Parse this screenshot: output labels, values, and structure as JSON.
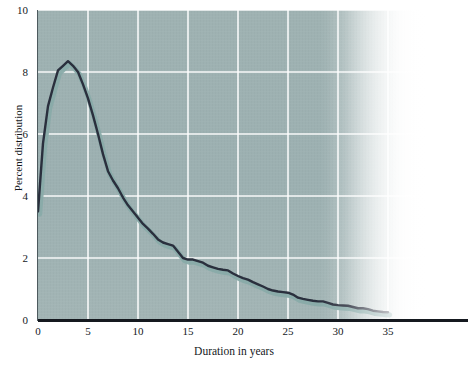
{
  "figure": {
    "title_remnant": "",
    "background_color": "#ffffff",
    "panel_color": "#9fb2b2",
    "gridline_color": "#ffffff",
    "line_color": "#2a2f3d",
    "shadow_color": "#8fb0ae",
    "axis_color": "#15191f"
  },
  "axes": {
    "x": {
      "label": "Duration in years",
      "ticks": [
        "0",
        "5",
        "10",
        "15",
        "20",
        "25",
        "30",
        "35"
      ],
      "tick_values": [
        0,
        5,
        10,
        15,
        20,
        25,
        30,
        35
      ],
      "min": 0,
      "max": 39
    },
    "y": {
      "label": "Percent distribution",
      "ticks": [
        "0",
        "2",
        "4",
        "6",
        "8",
        "10"
      ],
      "tick_values": [
        0,
        2,
        4,
        6,
        8,
        10
      ],
      "min": 0,
      "max": 10
    }
  },
  "chart_data": {
    "type": "line",
    "title": "",
    "subtitle": "",
    "xlabel": "Duration in years",
    "ylabel": "Percent distribution",
    "xlim": [
      0,
      39
    ],
    "ylim": [
      0,
      10
    ],
    "xticks": [
      0,
      5,
      10,
      15,
      20,
      25,
      30,
      35
    ],
    "yticks": [
      0,
      2,
      4,
      6,
      8,
      10
    ],
    "grid": true,
    "legend": "none",
    "annotations": [],
    "series": [
      {
        "name": "Percent distribution",
        "color": "#2a2f3d",
        "x": [
          0,
          0.5,
          1,
          1.5,
          2,
          2.5,
          3,
          3.5,
          4,
          4.5,
          5,
          5.5,
          6,
          6.5,
          7,
          7.5,
          8,
          8.5,
          9,
          9.5,
          10,
          10.5,
          11,
          11.5,
          12,
          12.5,
          13,
          13.5,
          14,
          14.5,
          15,
          15.5,
          16,
          16.5,
          17,
          17.5,
          18,
          18.5,
          19,
          19.5,
          20,
          20.5,
          21,
          21.5,
          22,
          22.5,
          23,
          23.5,
          24,
          24.5,
          25,
          25.5,
          26,
          26.5,
          27,
          27.5,
          28,
          28.5,
          29,
          29.5,
          30,
          30.5,
          31,
          31.5,
          32,
          32.5,
          33,
          33.5,
          34,
          34.5,
          35
        ],
        "y": [
          3.5,
          5.7,
          6.9,
          7.5,
          8.05,
          8.2,
          8.35,
          8.2,
          8.0,
          7.6,
          7.15,
          6.6,
          6.0,
          5.35,
          4.8,
          4.5,
          4.25,
          3.95,
          3.7,
          3.5,
          3.3,
          3.1,
          2.95,
          2.78,
          2.6,
          2.5,
          2.45,
          2.4,
          2.2,
          2.0,
          1.95,
          1.95,
          1.9,
          1.85,
          1.75,
          1.7,
          1.65,
          1.62,
          1.6,
          1.5,
          1.42,
          1.35,
          1.3,
          1.22,
          1.15,
          1.08,
          1.0,
          0.95,
          0.92,
          0.9,
          0.88,
          0.82,
          0.72,
          0.68,
          0.65,
          0.62,
          0.6,
          0.6,
          0.55,
          0.5,
          0.48,
          0.47,
          0.46,
          0.42,
          0.38,
          0.38,
          0.35,
          0.3,
          0.28,
          0.26,
          0.25
        ]
      }
    ]
  }
}
